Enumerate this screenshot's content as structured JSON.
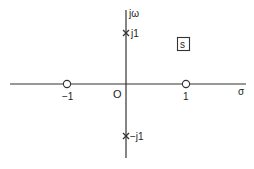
{
  "diagram": {
    "type": "pole-zero-plot",
    "plane_label": "s",
    "axes": {
      "horizontal_label": "σ",
      "vertical_label": "jω",
      "origin_label": "O"
    },
    "zeros": [
      {
        "label": "−1",
        "value": -1
      },
      {
        "label": "1",
        "value": 1
      }
    ],
    "poles": [
      {
        "label": "j1",
        "value": "j1"
      },
      {
        "label": "−j1",
        "value": "-j1"
      }
    ],
    "colors": {
      "line": "#333333",
      "background": "#ffffff"
    }
  }
}
